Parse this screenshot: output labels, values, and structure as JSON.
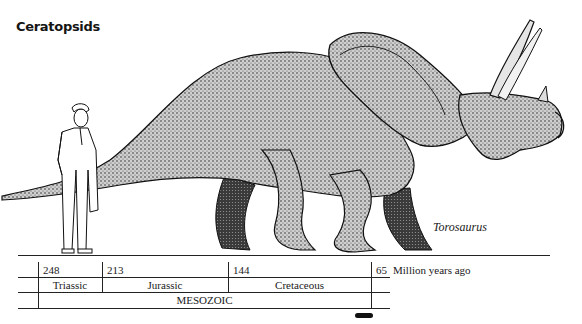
{
  "page": {
    "title": "Ceratopsids",
    "species_label": "Torosaurus"
  },
  "illustration": {
    "subjects": [
      "human-figure-scale",
      "torosaurus-dinosaur"
    ]
  },
  "timeline": {
    "ages": [
      {
        "value": "248"
      },
      {
        "value": "213"
      },
      {
        "value": "144"
      },
      {
        "value": "65"
      }
    ],
    "unit_label": "Million years ago",
    "periods": [
      {
        "name": "Triassic"
      },
      {
        "name": "Jurassic"
      },
      {
        "name": "Cretaceous"
      }
    ],
    "era": "MESOZOIC",
    "range_marker": "bar"
  }
}
